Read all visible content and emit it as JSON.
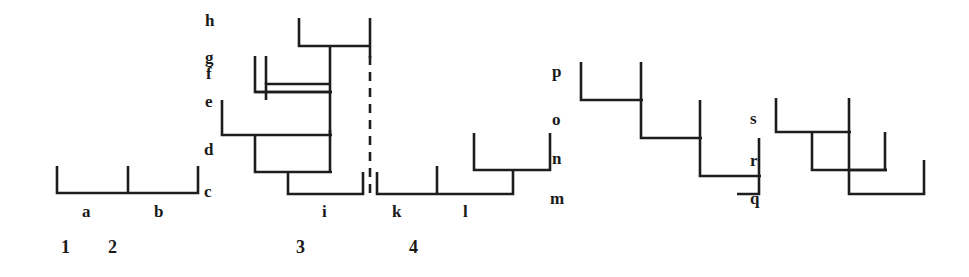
{
  "figure": {
    "type": "cladogram-set",
    "background_color": "#ffffff",
    "line_color": "#1d1d1d",
    "width": 969,
    "height": 277,
    "tree_count": 5
  },
  "labels": {
    "letters": [
      {
        "id": "h",
        "text": "h",
        "x": 205,
        "y": 12
      },
      {
        "id": "g",
        "text": "g",
        "x": 205,
        "y": 49
      },
      {
        "id": "f",
        "text": "f",
        "x": 206,
        "y": 65
      },
      {
        "id": "e",
        "text": "e",
        "x": 205,
        "y": 93
      },
      {
        "id": "d",
        "text": "d",
        "x": 204,
        "y": 141
      },
      {
        "id": "c",
        "text": "c",
        "x": 204,
        "y": 183
      },
      {
        "id": "a",
        "text": "a",
        "x": 82,
        "y": 203
      },
      {
        "id": "b",
        "text": "b",
        "x": 154,
        "y": 203
      },
      {
        "id": "i",
        "text": "i",
        "x": 322,
        "y": 203
      },
      {
        "id": "k",
        "text": "k",
        "x": 392,
        "y": 203
      },
      {
        "id": "l",
        "text": "l",
        "x": 463,
        "y": 203
      },
      {
        "id": "m",
        "text": "m",
        "x": 550,
        "y": 190
      },
      {
        "id": "n",
        "text": "n",
        "x": 552,
        "y": 150
      },
      {
        "id": "o",
        "text": "o",
        "x": 552,
        "y": 111
      },
      {
        "id": "p",
        "text": "p",
        "x": 552,
        "y": 63
      },
      {
        "id": "q",
        "text": "q",
        "x": 750,
        "y": 190
      },
      {
        "id": "r",
        "text": "r",
        "x": 750,
        "y": 152
      },
      {
        "id": "s",
        "text": "s",
        "x": 750,
        "y": 110
      }
    ],
    "numbers": [
      {
        "id": "1",
        "text": "1",
        "x": 61,
        "y": 238
      },
      {
        "id": "2",
        "text": "2",
        "x": 108,
        "y": 238
      },
      {
        "id": "3",
        "text": "3",
        "x": 296,
        "y": 238
      },
      {
        "id": "4",
        "text": "4",
        "x": 409,
        "y": 238
      }
    ]
  },
  "trees": [
    {
      "name": "tree-1",
      "group_label": "1",
      "tips": [
        "a",
        "b"
      ],
      "nodes": [
        "c"
      ],
      "shape": "simple-bracket-two-tips",
      "strokes": [
        {
          "kind": "polyline",
          "points": "57,166 57,193 198,193 198,166"
        },
        {
          "kind": "line",
          "x1": 128,
          "y1": 166,
          "x2": 128,
          "y2": 193
        }
      ]
    },
    {
      "name": "tree-2",
      "group_label": "2",
      "tips": [
        "i"
      ],
      "nodes": [
        "c",
        "d",
        "e",
        "f",
        "g",
        "h"
      ],
      "shape": "nested-asymmetric",
      "strokes": [
        {
          "kind": "polyline",
          "points": "266,100 266,84 330,84 330,68"
        },
        {
          "kind": "polyline",
          "points": "255,56 255,92 330,92"
        },
        {
          "kind": "polyline",
          "points": "299,18 299,46 370,46"
        },
        {
          "kind": "line",
          "x1": 330,
          "y1": 68,
          "x2": 330,
          "y2": 92
        },
        {
          "kind": "polyline",
          "points": "222,100 222,135 330,135 330,92"
        },
        {
          "kind": "polyline",
          "points": "255,135 255,172 330,172"
        },
        {
          "kind": "polyline",
          "points": "330,130 330,172"
        },
        {
          "kind": "polyline",
          "points": "288,172 288,193 363,193 363,172"
        },
        {
          "kind": "line",
          "x1": 370,
          "y1": 18,
          "x2": 370,
          "y2": 58,
          "dashed": false
        },
        {
          "kind": "line",
          "x1": 370,
          "y1": 58,
          "x2": 370,
          "y2": 196,
          "dashed": true
        }
      ]
    },
    {
      "name": "tree-3",
      "group_label": "3",
      "tips": [
        "k",
        "l"
      ],
      "nodes": [
        "m",
        "n"
      ],
      "shape": "bracket-with-nested-pair",
      "strokes": [
        {
          "kind": "polyline",
          "points": "377,172 377,194 513,194 513,170"
        },
        {
          "kind": "line",
          "x1": 437,
          "y1": 166,
          "x2": 437,
          "y2": 194
        },
        {
          "kind": "polyline",
          "points": "474,133 474,170 550,170 550,133"
        }
      ]
    },
    {
      "name": "tree-4",
      "group_label": "4",
      "tips": [],
      "nodes": [
        "m",
        "n",
        "o",
        "p"
      ],
      "shape": "staircase-ladder-4-steps",
      "strokes": [
        {
          "kind": "polyline",
          "points": "581,62 581,100 641,100 641,138"
        },
        {
          "kind": "line",
          "x1": 641,
          "y1": 62,
          "x2": 641,
          "y2": 100
        },
        {
          "kind": "polyline",
          "points": "641,138 700,138 700,176"
        },
        {
          "kind": "line",
          "x1": 700,
          "y1": 100,
          "x2": 700,
          "y2": 138
        },
        {
          "kind": "polyline",
          "points": "700,176 759,176 759,194"
        },
        {
          "kind": "line",
          "x1": 759,
          "y1": 138,
          "x2": 759,
          "y2": 176
        },
        {
          "kind": "line",
          "x1": 759,
          "y1": 194,
          "x2": 737,
          "y2": 194
        }
      ]
    },
    {
      "name": "tree-5",
      "group_label": "4",
      "tips": [],
      "nodes": [
        "q",
        "r",
        "s"
      ],
      "shape": "staircase-ladder-3-steps",
      "strokes": [
        {
          "kind": "polyline",
          "points": "776,98 776,132 849,132 849,98"
        },
        {
          "kind": "polyline",
          "points": "812,132 812,170 885,170 885,132"
        },
        {
          "kind": "polyline",
          "points": "849,170 849,194 924,194 924,160"
        }
      ]
    }
  ]
}
